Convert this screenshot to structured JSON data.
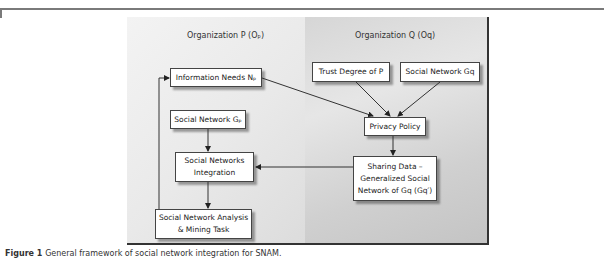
{
  "diagram": {
    "organizations": [
      {
        "id": "P",
        "label": "Organization P (Oₚ)"
      },
      {
        "id": "Q",
        "label": "Organization Q (Oq)"
      }
    ],
    "nodes": {
      "info_needs": {
        "label": "Information Needs Nₚ"
      },
      "social_network_p": {
        "label": "Social Network Gₚ"
      },
      "sn_integration": {
        "line1": "Social Networks",
        "line2": "Integration"
      },
      "snam_task": {
        "line1": "Social Network Analysis",
        "line2": "& Mining Task"
      },
      "trust_degree": {
        "label": "Trust Degree of P"
      },
      "social_network_q": {
        "label": "Social Network Gq"
      },
      "privacy_policy": {
        "label": "Privacy Policy"
      },
      "sharing_data": {
        "line1": "Sharing Data –",
        "line2": "Generalized Social",
        "line3": "Network of Gq (Gq′)"
      }
    },
    "edges": [
      {
        "from": "info_needs",
        "to": "privacy_policy"
      },
      {
        "from": "trust_degree",
        "to": "privacy_policy"
      },
      {
        "from": "social_network_q",
        "to": "privacy_policy"
      },
      {
        "from": "privacy_policy",
        "to": "sharing_data"
      },
      {
        "from": "sharing_data",
        "to": "sn_integration"
      },
      {
        "from": "social_network_p",
        "to": "sn_integration"
      },
      {
        "from": "sn_integration",
        "to": "snam_task"
      },
      {
        "from": "snam_task",
        "to": "info_needs"
      }
    ]
  },
  "caption": {
    "label": "Figure 1",
    "text": "General framework of social network integration for SNAM."
  }
}
